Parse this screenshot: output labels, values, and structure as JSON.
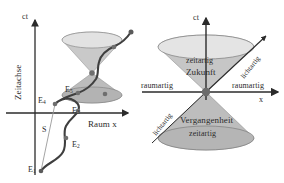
{
  "figure": {
    "background_color": "#ffffff",
    "ink_color": "#2b2b2b",
    "cone_fill_color": "#b9b9b9",
    "cone_fill_light_color": "#d6d6d6",
    "worldline_color": "#3a3a3a",
    "event_dot_color": "#6e6e6e"
  },
  "left_panel": {
    "name": "weltlinie-diagramm",
    "axes": {
      "time_axis_tip_label": "ct",
      "time_axis_name_label": "Zeitachse",
      "space_axis_label": "Raum x"
    },
    "events": [
      {
        "id": "E1",
        "label": "E",
        "sub": "1"
      },
      {
        "id": "E2",
        "label": "E",
        "sub": "2"
      },
      {
        "id": "E3",
        "label": "E",
        "sub": "3"
      },
      {
        "id": "E4",
        "label": "E",
        "sub": "4"
      },
      {
        "id": "E5",
        "label": "E",
        "sub": "5"
      }
    ],
    "segment_label": "S"
  },
  "right_panel": {
    "name": "lichtkegel-diagramm",
    "axes": {
      "time_axis_tip_label": "ct",
      "space_axis_tip_label": "x"
    },
    "labels": {
      "spacelike_left": "raumartig",
      "spacelike_right": "raumartig",
      "lightlike_upper_right": "lichtartig",
      "lightlike_lower_left": "lichtartig",
      "timelike_future": "zeitartig",
      "future": "Zukunft",
      "past": "Vergangenheit",
      "timelike_past": "zeitartig"
    }
  }
}
